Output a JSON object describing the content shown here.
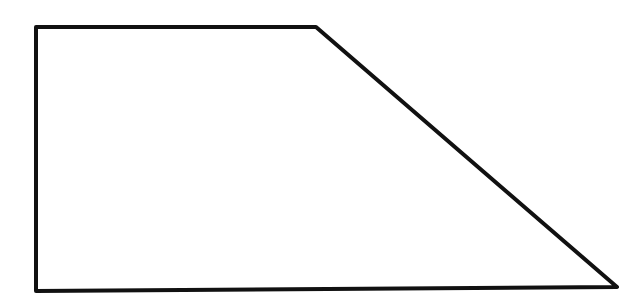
{
  "diagram": {
    "shape": "trapezoid",
    "stroke_color": "#111111",
    "fill_color": "#ffffff",
    "stroke_width": 4,
    "vertices": [
      [
        36,
        27
      ],
      [
        316,
        27
      ],
      [
        617,
        287
      ],
      [
        36,
        291
      ]
    ]
  }
}
